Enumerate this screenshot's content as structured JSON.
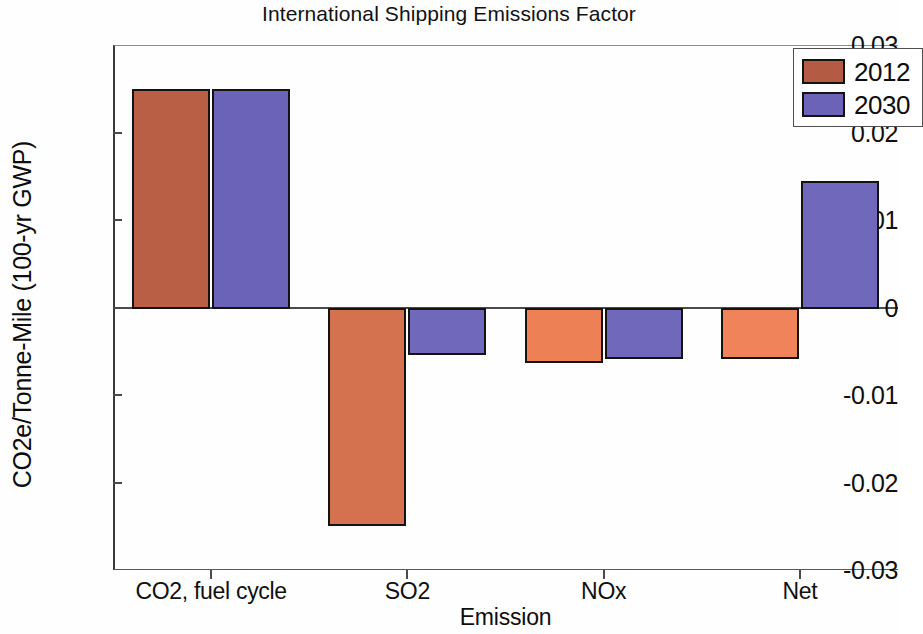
{
  "chart_data": {
    "type": "bar",
    "title": "International Shipping Emissions Factor",
    "xlabel": "Emission",
    "ylabel": "CO2e/Tonne-Mile (100-yr GWP)",
    "categories": [
      "CO2, fuel cycle",
      "SO2",
      "NOx",
      "Net"
    ],
    "series": [
      {
        "name": "2012",
        "color": "#c06449",
        "values": [
          0.025,
          -0.0248,
          -0.0062,
          -0.0058
        ]
      },
      {
        "name": "2030",
        "color": "#6a63b8",
        "values": [
          0.025,
          -0.0053,
          -0.0058,
          0.0145
        ]
      }
    ],
    "ylim": [
      -0.03,
      0.03
    ],
    "yticks": [
      "0.03",
      "0.02",
      "0.01",
      "0",
      "-0.01",
      "-0.02",
      "-0.03"
    ],
    "ytick_values": [
      0.03,
      0.02,
      0.01,
      0,
      -0.01,
      -0.02,
      -0.03
    ],
    "grid": false,
    "legend_position": "top-right",
    "bar_colors": {
      "co2_2012": "#b85f45",
      "co2_2030": "#6a63b8",
      "so2_2012": "#d4714f",
      "so2_2030": "#6f68bb",
      "nox_2012": "#ee8055",
      "nox_2030": "#6f68bb",
      "net_2012": "#f08359",
      "net_2030": "#6f68bb",
      "edge": "#15130f"
    },
    "legend_swatch_colors": {
      "2012": "#b45b44",
      "2030": "#6a63b8"
    }
  }
}
